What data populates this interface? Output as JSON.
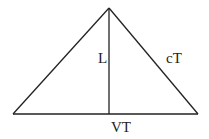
{
  "diagram": {
    "type": "triangle-with-altitude",
    "colors": {
      "stroke": "#222222",
      "background": "#ffffff"
    },
    "vertices": {
      "apex": [
        109,
        8
      ],
      "base_left": [
        13,
        114
      ],
      "base_right": [
        198,
        114
      ],
      "altitude_foot": [
        109,
        114
      ]
    },
    "labels": {
      "altitude": "L",
      "right_side": "cT",
      "base": "VT"
    }
  }
}
